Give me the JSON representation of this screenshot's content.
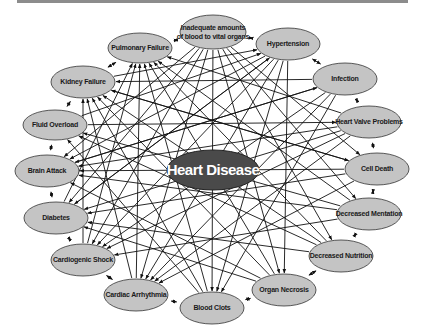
{
  "diagram": {
    "title": "Heart Disease",
    "center": {
      "label": "Heart Disease",
      "x": 213,
      "y": 170,
      "rx": 46,
      "ry": 20,
      "fill": "#4a4a4a",
      "text_color": "#ffffff"
    },
    "node_fill": "#c4c4c4",
    "node_stroke": "#333333",
    "edge_color": "#111111",
    "nodes": [
      {
        "id": "inadequate",
        "label": "Inadequate amounts",
        "label2": "of blood to vital organs",
        "x": 213,
        "y": 32,
        "rx": 33,
        "ry": 17
      },
      {
        "id": "hypertension",
        "label": "Hypertension",
        "x": 288,
        "y": 44,
        "rx": 32,
        "ry": 16
      },
      {
        "id": "infection",
        "label": "Infection",
        "x": 345,
        "y": 79,
        "rx": 32,
        "ry": 16
      },
      {
        "id": "heart-valve",
        "label": "Heart Valve Problems",
        "x": 369,
        "y": 122,
        "rx": 32,
        "ry": 16
      },
      {
        "id": "cell-death",
        "label": "Cell Death",
        "x": 377,
        "y": 169,
        "rx": 32,
        "ry": 16
      },
      {
        "id": "decreased-mentation",
        "label": "Decreased Mentation",
        "x": 369,
        "y": 214,
        "rx": 32,
        "ry": 16
      },
      {
        "id": "decreased-nutrition",
        "label": "Decreased Nutrition",
        "x": 341,
        "y": 256,
        "rx": 32,
        "ry": 16
      },
      {
        "id": "organ-necrosis",
        "label": "Organ Necrosis",
        "x": 284,
        "y": 290,
        "rx": 32,
        "ry": 16
      },
      {
        "id": "blood-clots",
        "label": "Blood Clots",
        "x": 212,
        "y": 308,
        "rx": 32,
        "ry": 16
      },
      {
        "id": "cardiac-arrhythmia",
        "label": "Cardiac Arrhythmia",
        "x": 136,
        "y": 295,
        "rx": 32,
        "ry": 16
      },
      {
        "id": "cardiogenic-shock",
        "label": "Cardiogenic Shock",
        "x": 83,
        "y": 260,
        "rx": 32,
        "ry": 16
      },
      {
        "id": "diabetes",
        "label": "Diabetes",
        "x": 56,
        "y": 218,
        "rx": 32,
        "ry": 16
      },
      {
        "id": "brain-attack",
        "label": "Brain Attack",
        "x": 47,
        "y": 171,
        "rx": 32,
        "ry": 16
      },
      {
        "id": "fluid-overload",
        "label": "Fluid Overload",
        "x": 55,
        "y": 125,
        "rx": 32,
        "ry": 15
      },
      {
        "id": "kidney-failure",
        "label": "Kidney Failure",
        "x": 83,
        "y": 82,
        "rx": 32,
        "ry": 16
      },
      {
        "id": "pulmonary-failure",
        "label": "Pulmonary Failure",
        "x": 140,
        "y": 48,
        "rx": 32,
        "ry": 15
      }
    ],
    "ring_edges": [
      [
        0,
        1
      ],
      [
        1,
        2
      ],
      [
        2,
        3
      ],
      [
        3,
        4
      ],
      [
        4,
        5
      ],
      [
        5,
        6
      ],
      [
        6,
        7
      ],
      [
        7,
        8
      ],
      [
        8,
        9
      ],
      [
        9,
        10
      ],
      [
        10,
        11
      ],
      [
        11,
        12
      ],
      [
        12,
        13
      ],
      [
        13,
        14
      ],
      [
        14,
        15
      ],
      [
        15,
        0
      ]
    ],
    "cross_edges": [
      [
        0,
        8
      ],
      [
        0,
        9
      ],
      [
        0,
        7
      ],
      [
        0,
        10
      ],
      [
        0,
        6
      ],
      [
        0,
        11
      ],
      [
        0,
        5
      ],
      [
        0,
        12
      ],
      [
        0,
        4
      ],
      [
        1,
        8
      ],
      [
        1,
        9
      ],
      [
        1,
        10
      ],
      [
        1,
        11
      ],
      [
        1,
        7
      ],
      [
        1,
        12
      ],
      [
        2,
        9
      ],
      [
        2,
        8
      ],
      [
        2,
        10
      ],
      [
        2,
        12
      ],
      [
        2,
        14
      ],
      [
        3,
        9
      ],
      [
        3,
        10
      ],
      [
        3,
        11
      ],
      [
        3,
        15
      ],
      [
        3,
        12
      ],
      [
        4,
        11
      ],
      [
        4,
        12
      ],
      [
        4,
        9
      ],
      [
        4,
        14
      ],
      [
        5,
        12
      ],
      [
        5,
        13
      ],
      [
        5,
        15
      ],
      [
        5,
        10
      ],
      [
        6,
        13
      ],
      [
        6,
        14
      ],
      [
        6,
        11
      ],
      [
        6,
        15
      ],
      [
        7,
        14
      ],
      [
        7,
        15
      ],
      [
        7,
        12
      ],
      [
        7,
        11
      ],
      [
        8,
        15
      ],
      [
        8,
        14
      ],
      [
        8,
        13
      ],
      [
        9,
        15
      ],
      [
        9,
        14
      ],
      [
        10,
        14
      ],
      [
        10,
        15
      ],
      [
        11,
        15
      ],
      [
        11,
        1
      ],
      [
        12,
        2
      ],
      [
        13,
        1
      ],
      [
        13,
        3
      ],
      [
        14,
        1
      ],
      [
        14,
        4
      ]
    ]
  }
}
